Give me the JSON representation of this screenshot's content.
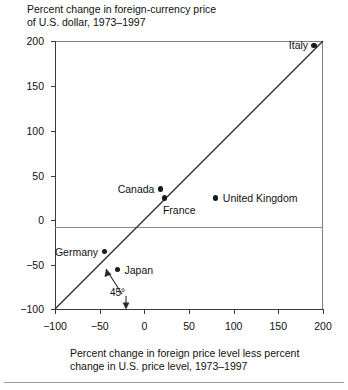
{
  "chart_data": {
    "type": "scatter",
    "title": "Percent change in foreign-currency price\nof U.S. dollar, 1973–1997",
    "ylabel": "Percent change in foreign-currency price of U.S. dollar, 1973–1997",
    "xlabel": "Percent change in foreign price level less percent\nchange in U.S. price level, 1973–1997",
    "xlim": [
      -100,
      200
    ],
    "ylim": [
      -100,
      200
    ],
    "xticks": [
      -100,
      -50,
      0,
      50,
      100,
      150,
      200
    ],
    "xtick_labels": [
      "−100",
      "−50",
      "0",
      "50",
      "100",
      "150",
      "200"
    ],
    "yticks": [
      -100,
      -50,
      0,
      50,
      100,
      150,
      200
    ],
    "ytick_labels": [
      "−100",
      "−50",
      "0",
      "50",
      "100",
      "150",
      "200"
    ],
    "grid": false,
    "legend": "none",
    "points": [
      {
        "label": "Italy",
        "x": 190,
        "y": 195,
        "label_side": "left"
      },
      {
        "label": "Canada",
        "x": 18,
        "y": 35,
        "label_side": "left"
      },
      {
        "label": "France",
        "x": 23,
        "y": 25,
        "label_side": "below-right"
      },
      {
        "label": "United Kingdom",
        "x": 80,
        "y": 25,
        "label_side": "right"
      },
      {
        "label": "Germany",
        "x": -45,
        "y": -35,
        "label_side": "left"
      },
      {
        "label": "Japan",
        "x": -30,
        "y": -55,
        "label_side": "right"
      }
    ],
    "reference_line": {
      "name": "45° line",
      "annotation": "45°",
      "from": [
        -100,
        -100
      ],
      "to": [
        200,
        200
      ]
    }
  },
  "chart": {
    "title": "Percent change in foreign-currency price\nof U.S. dollar, 1973–1997",
    "x_caption": "Percent change in foreign price level less percent\nchange in U.S. price level, 1973–1997",
    "angle_annotation": "45°",
    "colors": {
      "point": "#1a1a1a",
      "axis": "#3a3a3a",
      "frame": "#7e7e7e",
      "zero_line": "#8a8a8a",
      "text": "#111111",
      "background": "#ffffff"
    }
  }
}
